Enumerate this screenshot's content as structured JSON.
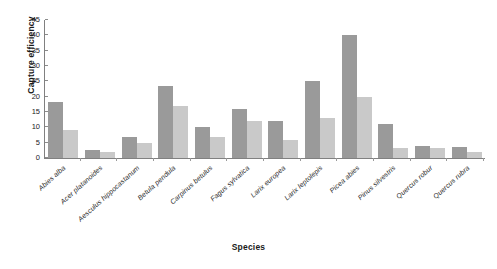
{
  "chart_data": {
    "type": "bar",
    "title": "",
    "xlabel": "Species",
    "ylabel": "Capture efficiency",
    "ylim": [
      0,
      45
    ],
    "ytick_step": 5,
    "yticks": [
      0,
      5,
      10,
      15,
      20,
      25,
      30,
      35,
      40,
      45
    ],
    "grid": false,
    "legend": "none",
    "bar_colors": {
      "series_1": "#9a9a9a",
      "series_2": "#c9c9c9"
    },
    "categories": [
      "Abies alba",
      "Acer platanoides",
      "Aesculus hippocastanum",
      "Betula pendula",
      "Carpinus betulus",
      "Fagus sylvatica",
      "Larix europea",
      "Larix leptolepis",
      "Picea abies",
      "Pinus silvestris",
      "Quercus robur",
      "Quercus rubra"
    ],
    "series": [
      {
        "name": "series_1",
        "values": [
          18.2,
          2.7,
          7.0,
          23.5,
          10.0,
          16.0,
          12.0,
          25.2,
          40.0,
          11.0,
          4.0,
          3.5
        ]
      },
      {
        "name": "series_2",
        "values": [
          9.0,
          1.8,
          5.0,
          17.0,
          7.0,
          12.0,
          6.0,
          13.0,
          20.0,
          3.2,
          3.2,
          2.0
        ]
      }
    ]
  },
  "axes": {
    "y_title": "Capture efficiency",
    "x_title": "Species"
  }
}
